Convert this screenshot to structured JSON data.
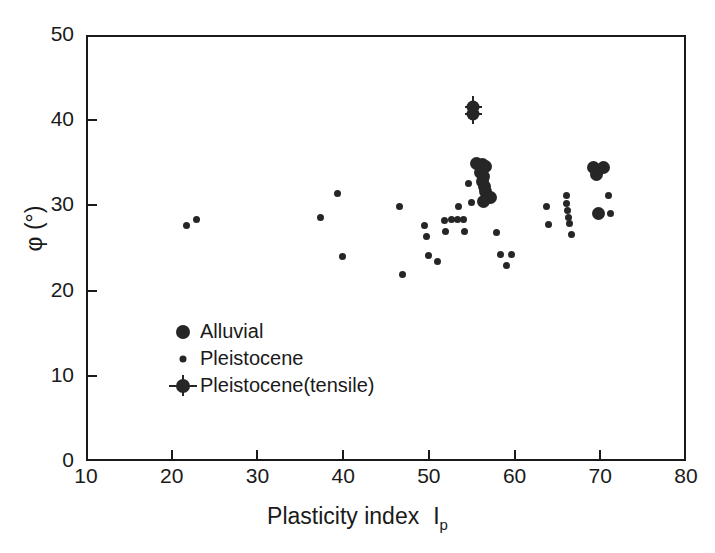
{
  "chart_data": {
    "type": "scatter",
    "title": "",
    "xlabel": "Plasticity index  Ip",
    "xlabel_text": "Plasticity index",
    "xlabel_symbol": "I",
    "xlabel_subscript": "p",
    "ylabel": "φ (°)",
    "xlim": [
      10,
      80
    ],
    "ylim": [
      0,
      50
    ],
    "xticks": [
      10,
      20,
      30,
      40,
      50,
      60,
      70,
      80
    ],
    "yticks": [
      0,
      10,
      20,
      30,
      40,
      50
    ],
    "grid": false,
    "legend_position": "lower-left-inside",
    "marker_color": "#262626",
    "axis_color": "#1a1a1a",
    "background": "#ffffff",
    "series": [
      {
        "name": "Alluvial",
        "marker": "large-filled-circle",
        "marker_size_px": 13,
        "points": [
          [
            55.6,
            34.9
          ],
          [
            56.2,
            34.8
          ],
          [
            56.6,
            34.6
          ],
          [
            56.0,
            33.9
          ],
          [
            56.4,
            33.4
          ],
          [
            56.3,
            32.8
          ],
          [
            56.5,
            32.2
          ],
          [
            56.6,
            31.6
          ],
          [
            56.8,
            31.0
          ],
          [
            57.2,
            30.9
          ],
          [
            56.4,
            30.4
          ],
          [
            69.2,
            34.4
          ],
          [
            70.4,
            34.5
          ],
          [
            69.6,
            33.6
          ],
          [
            69.8,
            29.0
          ]
        ]
      },
      {
        "name": "Pleistocene",
        "marker": "small-filled-circle",
        "marker_size_px": 7,
        "points": [
          [
            21.7,
            27.6
          ],
          [
            22.9,
            28.4
          ],
          [
            37.4,
            28.6
          ],
          [
            39.3,
            31.4
          ],
          [
            39.9,
            24.0
          ],
          [
            46.6,
            29.9
          ],
          [
            46.9,
            21.9
          ],
          [
            49.5,
            27.6
          ],
          [
            49.7,
            26.3
          ],
          [
            49.9,
            24.1
          ],
          [
            51.8,
            28.2
          ],
          [
            51.9,
            26.9
          ],
          [
            52.6,
            28.4
          ],
          [
            53.3,
            28.3
          ],
          [
            53.4,
            29.9
          ],
          [
            54.0,
            28.4
          ],
          [
            54.2,
            26.9
          ],
          [
            54.6,
            32.6
          ],
          [
            55.0,
            30.3
          ],
          [
            51.0,
            23.4
          ],
          [
            57.9,
            26.8
          ],
          [
            58.3,
            24.2
          ],
          [
            59.6,
            24.2
          ],
          [
            59.0,
            22.9
          ],
          [
            63.7,
            29.9
          ],
          [
            64.0,
            27.8
          ],
          [
            66.0,
            31.2
          ],
          [
            66.1,
            30.2
          ],
          [
            66.2,
            29.4
          ],
          [
            66.3,
            28.6
          ],
          [
            66.4,
            27.9
          ],
          [
            66.6,
            26.6
          ],
          [
            71.0,
            31.2
          ],
          [
            71.2,
            29.1
          ]
        ]
      },
      {
        "name": "Pleistocene(tensile)",
        "marker": "circle-with-error-bars",
        "marker_size_px": 13,
        "points": [
          [
            55.2,
            41.6
          ],
          [
            55.2,
            40.7
          ]
        ],
        "error_bars": {
          "x_err": 1.0,
          "y_err": 1.2
        }
      }
    ]
  },
  "axes": {
    "x": {
      "ticks": [
        {
          "value": 10,
          "label": "10"
        },
        {
          "value": 20,
          "label": "20"
        },
        {
          "value": 30,
          "label": "30"
        },
        {
          "value": 40,
          "label": "40"
        },
        {
          "value": 50,
          "label": "50"
        },
        {
          "value": 60,
          "label": "60"
        },
        {
          "value": 70,
          "label": "70"
        },
        {
          "value": 80,
          "label": "80"
        }
      ]
    },
    "y": {
      "ticks": [
        {
          "value": 0,
          "label": "0"
        },
        {
          "value": 10,
          "label": "10"
        },
        {
          "value": 20,
          "label": "20"
        },
        {
          "value": 30,
          "label": "30"
        },
        {
          "value": 40,
          "label": "40"
        },
        {
          "value": 50,
          "label": "50"
        }
      ]
    }
  },
  "legend": {
    "items": [
      {
        "label": "Alluvial",
        "marker": "large-filled-circle"
      },
      {
        "label": "Pleistocene",
        "marker": "small-filled-circle"
      },
      {
        "label": "Pleistocene(tensile)",
        "marker": "circle-with-error-bars"
      }
    ]
  },
  "labels": {
    "x_title_main": "Plasticity index",
    "x_title_symbol": "I",
    "x_title_sub": "p",
    "y_title": "φ (°)"
  }
}
